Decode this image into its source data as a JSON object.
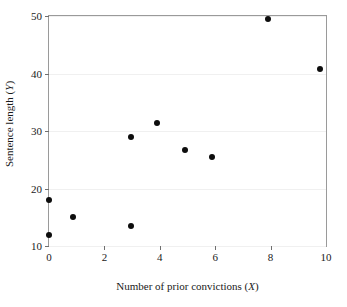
{
  "chart_data": {
    "type": "scatter",
    "title": "",
    "xlabel": "Number of prior convictions (X)",
    "ylabel": "Sentence length (Y)",
    "xlim": [
      0,
      10
    ],
    "ylim": [
      10,
      50
    ],
    "xticks": [
      0,
      2,
      4,
      6,
      8,
      10
    ],
    "yticks": [
      10,
      20,
      30,
      40,
      50
    ],
    "xtick_labels": [
      "0",
      "2",
      "4",
      "6",
      "8",
      "10"
    ],
    "ytick_labels": [
      "10",
      "20",
      "30",
      "40",
      "50"
    ],
    "grid": true,
    "grid_axis": "y",
    "legend": false,
    "marker": "filled-circle",
    "marker_color": "#0d0d0d",
    "frame_color": "#9a9a9a",
    "grid_color": "#f0f0f0",
    "background": "#ffffff",
    "n_points": 10,
    "x": [
      0,
      0,
      0.85,
      2.95,
      2.95,
      3.9,
      4.9,
      5.9,
      7.9,
      9.8
    ],
    "y": [
      18.0,
      12.0,
      15.0,
      29.0,
      13.4,
      31.4,
      26.7,
      25.4,
      49.4,
      40.8
    ],
    "points": [
      {
        "x": 0,
        "y": 18.0
      },
      {
        "x": 0,
        "y": 12.0
      },
      {
        "x": 0.85,
        "y": 15.0
      },
      {
        "x": 2.95,
        "y": 29.0
      },
      {
        "x": 2.95,
        "y": 13.4
      },
      {
        "x": 3.9,
        "y": 31.4
      },
      {
        "x": 4.9,
        "y": 26.7
      },
      {
        "x": 5.9,
        "y": 25.4
      },
      {
        "x": 7.9,
        "y": 49.4
      },
      {
        "x": 9.8,
        "y": 40.8
      }
    ]
  },
  "axis_labels": {
    "x_prefix": "Number of prior convictions (",
    "x_var": "X",
    "x_suffix": ")",
    "y_prefix": "Sentence length (",
    "y_var": "Y",
    "y_suffix": ")"
  }
}
